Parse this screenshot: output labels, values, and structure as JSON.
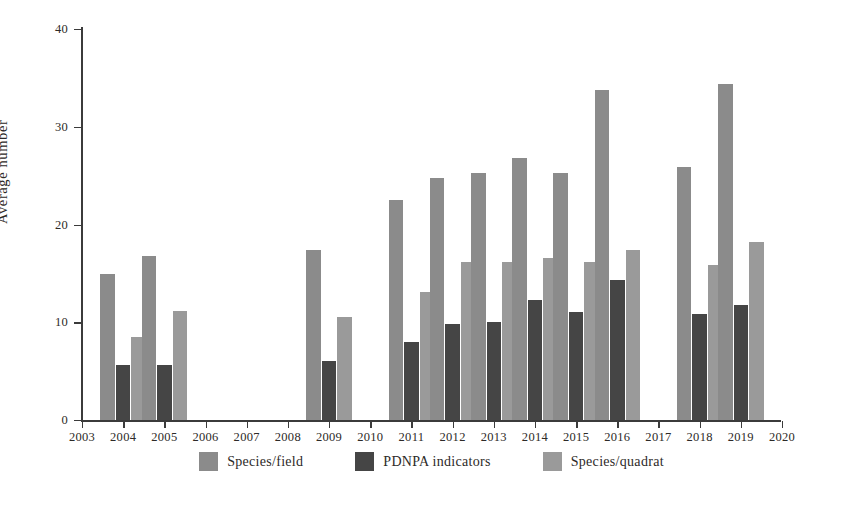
{
  "chart_data": {
    "type": "bar",
    "title": "",
    "subtitle": "",
    "xlabel": "",
    "ylabel": "Average number",
    "ylim": [
      0,
      40
    ],
    "yticks": [
      0,
      10,
      20,
      30,
      40
    ],
    "ytick_labels": [
      "0",
      "10",
      "20",
      "30",
      "40"
    ],
    "xlim": [
      2003,
      2020
    ],
    "grid": false,
    "legend_position": "bottom-center",
    "categories": [
      "2003",
      "2004",
      "2005",
      "2006",
      "2007",
      "2008",
      "2009",
      "2010",
      "2011",
      "2012",
      "2013",
      "2014",
      "2015",
      "2016",
      "2017",
      "2018",
      "2019",
      "2020"
    ],
    "series": [
      {
        "name": "Species/field",
        "color": "#8b8b8b",
        "values": [
          null,
          14.9,
          16.8,
          null,
          null,
          null,
          17.4,
          null,
          22.5,
          24.8,
          25.3,
          26.8,
          25.3,
          33.8,
          null,
          25.9,
          34.4,
          null
        ]
      },
      {
        "name": "PDNPA indicators",
        "color": "#454545",
        "values": [
          null,
          5.6,
          5.6,
          null,
          null,
          null,
          6.0,
          null,
          8.0,
          9.8,
          10.0,
          12.3,
          11.0,
          14.3,
          null,
          10.8,
          11.8,
          null
        ]
      },
      {
        "name": "Species/quadrat",
        "color": "#9a9a9a",
        "values": [
          null,
          8.5,
          11.2,
          null,
          null,
          null,
          10.5,
          null,
          13.1,
          16.2,
          16.2,
          16.6,
          16.2,
          17.4,
          null,
          15.9,
          18.2,
          null
        ]
      }
    ]
  },
  "axis": {
    "y_title": "Average number",
    "axis_color": "#3b3b3b"
  },
  "legend": {
    "items": [
      {
        "label": "Species/field",
        "color": "#8b8b8b"
      },
      {
        "label": "PDNPA indicators",
        "color": "#454545"
      },
      {
        "label": "Species/quadrat",
        "color": "#9a9a9a"
      }
    ]
  }
}
